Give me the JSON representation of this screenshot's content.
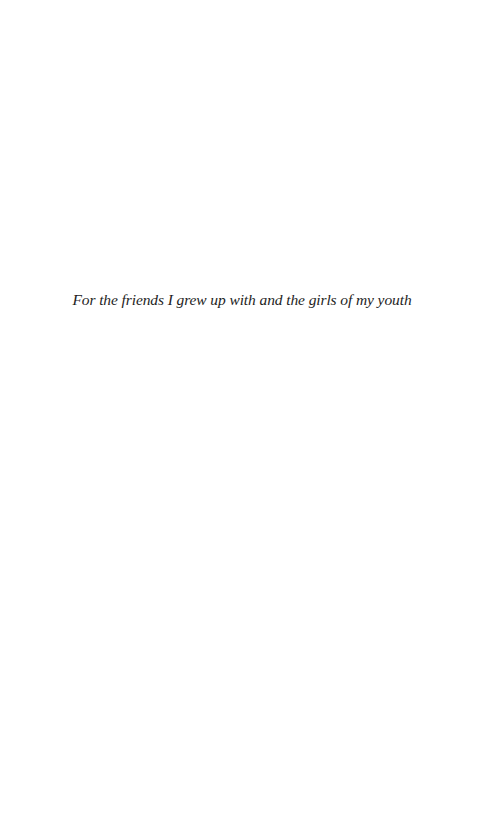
{
  "page": {
    "type": "dedication",
    "background_color": "#ffffff",
    "text_color": "#1e1e1e",
    "dedication_text": "For the friends I grew up with and the girls of my youth"
  }
}
